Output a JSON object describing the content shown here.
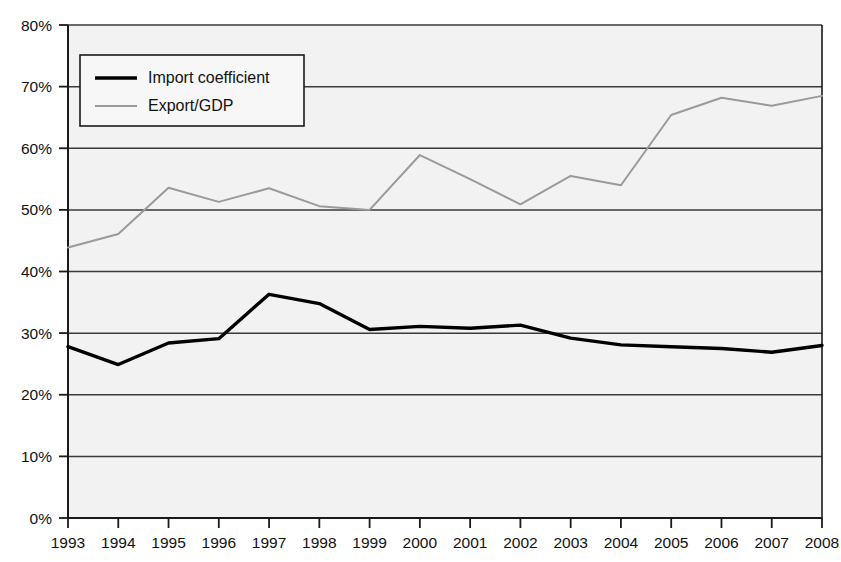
{
  "chart_data": {
    "type": "line",
    "title": "",
    "subtitle": "",
    "xlabel": "",
    "ylabel": "",
    "categories": [
      "1993",
      "1994",
      "1995",
      "1996",
      "1997",
      "1998",
      "1999",
      "2000",
      "2001",
      "2002",
      "2003",
      "2004",
      "2005",
      "2006",
      "2007",
      "2008"
    ],
    "x": [
      1993,
      1994,
      1995,
      1996,
      1997,
      1998,
      1999,
      2000,
      2001,
      2002,
      2003,
      2004,
      2005,
      2006,
      2007,
      2008
    ],
    "series": [
      {
        "name": "Import coefficient",
        "color": "#000000",
        "width": 3.4,
        "values": [
          27.8,
          24.9,
          28.4,
          29.1,
          36.3,
          34.8,
          30.6,
          31.1,
          30.8,
          31.3,
          29.2,
          28.1,
          27.8,
          27.5,
          26.9,
          28.0
        ]
      },
      {
        "name": "Export/GDP",
        "color": "#9a9a9a",
        "width": 2.0,
        "values": [
          43.9,
          46.1,
          53.6,
          51.3,
          53.5,
          50.6,
          50.0,
          58.9,
          55.0,
          50.9,
          55.5,
          54.0,
          65.4,
          68.2,
          66.9,
          68.5
        ]
      }
    ],
    "ylim": [
      0,
      80
    ],
    "yticks": [
      0,
      10,
      20,
      30,
      40,
      50,
      60,
      70,
      80
    ],
    "ytick_labels": [
      "0%",
      "10%",
      "20%",
      "30%",
      "40%",
      "50%",
      "60%",
      "70%",
      "80%"
    ],
    "xlim": [
      1993,
      2008
    ],
    "grid": {
      "horizontal": true,
      "vertical": false,
      "color": "#3a3a3a"
    },
    "units": "percent",
    "legend": {
      "position": "top-left-inside",
      "entries": [
        {
          "label": "Import coefficient",
          "marker": "thick-black-line"
        },
        {
          "label": "Export/GDP",
          "marker": "thin-gray-line"
        }
      ]
    },
    "plot_background": "#f2f2f2",
    "axis_color": "#1a1a1a"
  }
}
